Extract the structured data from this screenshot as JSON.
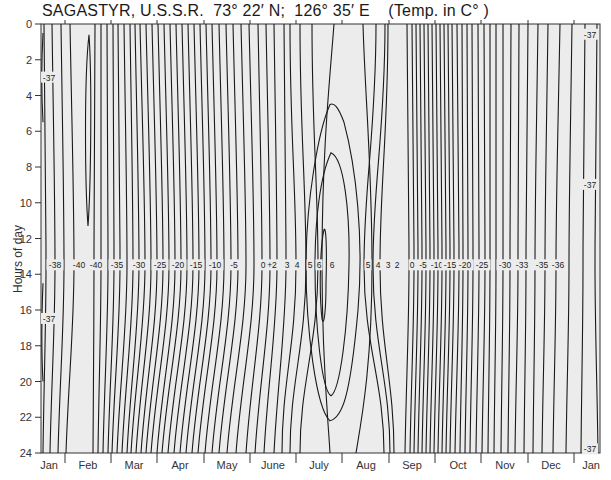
{
  "title": "SAGASTYR, U.S.S.R.  73° 22′ N;  126° 35′ E    (Temp. in C° )",
  "colors": {
    "background": "#ececec",
    "line": "#1a1a1a",
    "axis": "#333333"
  },
  "chart_data": {
    "type": "contour",
    "xlabel": "",
    "ylabel": "Hours of day",
    "x_categories": [
      "Jan",
      "Feb",
      "Mar",
      "Apr",
      "May",
      "June",
      "July",
      "Aug",
      "Sep",
      "Oct",
      "Nov",
      "Dec",
      "Jan"
    ],
    "y_ticks": [
      0,
      2,
      4,
      6,
      8,
      10,
      12,
      14,
      16,
      18,
      20,
      22,
      24
    ],
    "ylim": [
      0,
      24
    ],
    "y_inverted": true,
    "grid": false,
    "contour_labels_row_hour": 13.5,
    "contour_labels": [
      "-38",
      "-40",
      "-40",
      "-35",
      "-30",
      "-25",
      "-20",
      "-15",
      "-10",
      "-5",
      "0",
      "+2",
      "3",
      "4",
      "5",
      "6",
      "6",
      "5",
      "4",
      "3",
      "2",
      "0",
      "-5",
      "-10",
      "-15",
      "-20",
      "-25",
      "-30",
      "-33",
      "-35",
      "-36"
    ],
    "edge_labels": [
      {
        "value": "-37",
        "position": "left, hour 3"
      },
      {
        "value": "-37",
        "position": "left, hour 16.5"
      },
      {
        "value": "-37",
        "position": "right, hour 0.5"
      },
      {
        "value": "-37",
        "position": "right, hour 9"
      },
      {
        "value": "-37",
        "position": "right, hour 23.8"
      }
    ],
    "min_temp_c": -40,
    "max_temp_c": 6,
    "max_location": "July, around 12-16 h",
    "min_location": "mid-February"
  },
  "axes": {
    "y_label": "Hours of day",
    "y_tick_labels": [
      "0",
      "2",
      "4",
      "6",
      "8",
      "10",
      "12",
      "14",
      "16",
      "18",
      "20",
      "22",
      "24"
    ],
    "x_month_labels": [
      "Jan",
      "Feb",
      "Mar",
      "Apr",
      "May",
      "June",
      "July",
      "Aug",
      "Sep",
      "Oct",
      "Nov",
      "Dec",
      "Jan"
    ]
  }
}
